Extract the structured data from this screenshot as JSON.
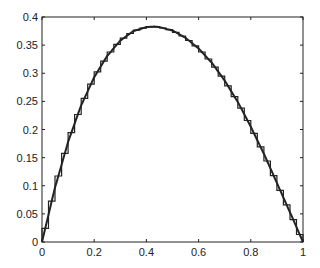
{
  "chart_data": {
    "type": "line",
    "title": "",
    "xlabel": "",
    "ylabel": "",
    "xlim": [
      0,
      1
    ],
    "ylim": [
      0,
      0.4
    ],
    "grid": false,
    "x_ticks": [
      "0",
      "0.2",
      "0.4",
      "0.6",
      "0.8",
      "1"
    ],
    "y_ticks": [
      "0",
      "0.05",
      "0.1",
      "0.15",
      "0.2",
      "0.25",
      "0.3",
      "0.35",
      "0.4"
    ],
    "series": [
      {
        "name": "smooth curve",
        "style": "solid line",
        "x": [
          0,
          0.05,
          0.1,
          0.15,
          0.2,
          0.25,
          0.3,
          0.35,
          0.4,
          0.43,
          0.45,
          0.5,
          0.55,
          0.6,
          0.65,
          0.7,
          0.75,
          0.8,
          0.85,
          0.9,
          0.95,
          1.0
        ],
        "values": [
          0,
          0.097,
          0.178,
          0.243,
          0.293,
          0.331,
          0.358,
          0.375,
          0.382,
          0.383,
          0.382,
          0.376,
          0.363,
          0.344,
          0.319,
          0.287,
          0.249,
          0.205,
          0.157,
          0.105,
          0.053,
          0
        ]
      },
      {
        "name": "piecewise-constant approximation",
        "style": "staircase",
        "step_width": 0.025
      }
    ]
  }
}
